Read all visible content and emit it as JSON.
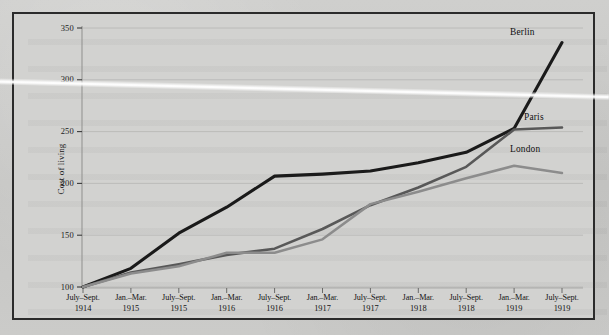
{
  "figure": {
    "yaxis_title": "Cost of living",
    "background_color": "#d2d2d0",
    "frame_color": "#2b2b2b"
  },
  "series_labels": {
    "berlin": "Berlin",
    "paris": "Paris",
    "london": "London"
  },
  "colors": {
    "berlin": "#1a1a1a",
    "paris": "#585858",
    "london": "#8c8c8c",
    "gridline": "#b9b9b7"
  },
  "chart_data": {
    "type": "line",
    "title": "",
    "xlabel": "",
    "ylabel": "Cost of living",
    "ylim": [
      100,
      350
    ],
    "yticks": [
      100,
      150,
      200,
      250,
      300,
      350
    ],
    "ytick_labels": [
      "100",
      "150",
      "200",
      "250",
      "300",
      "350"
    ],
    "grid": true,
    "legend_position": "inline-right-end-labels",
    "categories": [
      "July–Sept. 1914",
      "Jan.–Mar. 1915",
      "July–Sept. 1915",
      "Jan.–Mar. 1916",
      "July–Sept. 1916",
      "Jan.–Mar. 1917",
      "July–Sept. 1917",
      "Jan.–Mar. 1918",
      "July–Sept. 1918",
      "Jan.–Mar. 1919",
      "July–Sept. 1919"
    ],
    "categories_split": [
      {
        "line1": "July–Sept.",
        "line2": "1914"
      },
      {
        "line1": "Jan.–Mar.",
        "line2": "1915"
      },
      {
        "line1": "July–Sept.",
        "line2": "1915"
      },
      {
        "line1": "Jan.–Mar.",
        "line2": "1916"
      },
      {
        "line1": "July–Sept.",
        "line2": "1916"
      },
      {
        "line1": "Jan.–Mar.",
        "line2": "1917"
      },
      {
        "line1": "July–Sept.",
        "line2": "1917"
      },
      {
        "line1": "Jan.–Mar.",
        "line2": "1918"
      },
      {
        "line1": "July–Sept.",
        "line2": "1918"
      },
      {
        "line1": "Jan.–Mar.",
        "line2": "1919"
      },
      {
        "line1": "July–Sept.",
        "line2": "1919"
      }
    ],
    "series": [
      {
        "name": "Berlin",
        "color": "#1a1a1a",
        "values": [
          100,
          118,
          152,
          177,
          207,
          209,
          212,
          220,
          230,
          253,
          336
        ]
      },
      {
        "name": "Paris",
        "color": "#585858",
        "values": [
          100,
          114,
          122,
          131,
          137,
          156,
          179,
          196,
          216,
          252,
          254
        ]
      },
      {
        "name": "London",
        "color": "#8c8c8c",
        "values": [
          100,
          113,
          120,
          133,
          133,
          146,
          180,
          192,
          205,
          217,
          210
        ]
      }
    ]
  }
}
